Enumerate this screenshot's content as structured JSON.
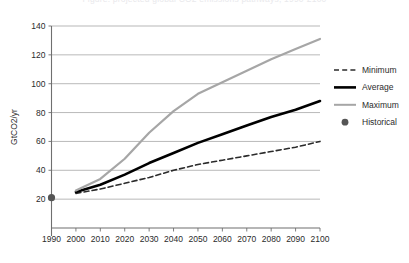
{
  "figure": {
    "cropped_caption_top": "Figure: projected global CO2 emissions pathways, 1990-2100",
    "background_color": "#ffffff"
  },
  "chart_data": {
    "type": "line",
    "title": "",
    "xlabel": "",
    "ylabel": "GtCO2/yr",
    "xlim": [
      1990,
      2100
    ],
    "ylim": [
      0,
      140
    ],
    "yticks": [
      20,
      40,
      60,
      80,
      100,
      120,
      140
    ],
    "xticks": [
      1990,
      2000,
      2010,
      2020,
      2030,
      2040,
      2050,
      2060,
      2070,
      2080,
      2090,
      2100
    ],
    "grid": true,
    "legend_position": "right",
    "x": [
      2000,
      2010,
      2020,
      2030,
      2040,
      2050,
      2060,
      2070,
      2080,
      2090,
      2100
    ],
    "series": [
      {
        "name": "Minimum",
        "color": "#2b2b2b",
        "style": "dashed",
        "width": 1.6,
        "values": [
          24,
          27,
          31,
          35,
          40,
          44,
          47,
          50,
          53,
          56,
          60
        ]
      },
      {
        "name": "Average",
        "color": "#000000",
        "style": "solid",
        "width": 2.6,
        "values": [
          25,
          30,
          37,
          45,
          52,
          59,
          65,
          71,
          77,
          82,
          88
        ]
      },
      {
        "name": "Maximum",
        "color": "#a6a6a6",
        "style": "solid",
        "width": 2.2,
        "values": [
          26,
          34,
          48,
          66,
          81,
          93,
          101,
          109,
          117,
          124,
          131
        ]
      }
    ],
    "points": [
      {
        "name": "Historical",
        "color": "#555555",
        "marker": "circle",
        "x": 1990,
        "y": 21
      }
    ],
    "legend_entries": [
      {
        "label": "Minimum",
        "marker": "dashed-line",
        "color": "#2b2b2b"
      },
      {
        "label": "Average",
        "marker": "thick-solid-line",
        "color": "#000000"
      },
      {
        "label": "Maximum",
        "marker": "solid-line",
        "color": "#a6a6a6"
      },
      {
        "label": "Historical",
        "marker": "circle-dot",
        "color": "#555555"
      }
    ]
  },
  "axis": {
    "y_title": "GtCO2/yr",
    "y_tick_labels": [
      "140",
      "120",
      "100",
      "80",
      "60",
      "40",
      "20"
    ],
    "x_tick_labels": [
      "1990",
      "2000",
      "2010",
      "2020",
      "2030",
      "2040",
      "2050",
      "2060",
      "2070",
      "2080",
      "2090",
      "2100"
    ]
  },
  "legend": {
    "items": [
      {
        "label": "Minimum"
      },
      {
        "label": "Average"
      },
      {
        "label": "Maximum"
      },
      {
        "label": "Historical"
      }
    ]
  }
}
